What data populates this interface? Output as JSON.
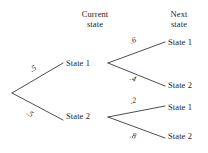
{
  "diagram": {
    "type": "probability-tree",
    "headers": {
      "current": "Current\nstate",
      "next": "Next\nstate"
    },
    "root": {
      "x": 12,
      "y": 93
    },
    "current_states": [
      {
        "id": "cur-1",
        "label": "State 1",
        "x": 66,
        "y": 63,
        "branch_probability": ".5"
      },
      {
        "id": "cur-2",
        "label": "State 2",
        "x": 66,
        "y": 116,
        "branch_probability": ".5"
      }
    ],
    "next_states": [
      {
        "id": "leaf-1",
        "label": "State 1",
        "from": "cur-1",
        "probability": ".6",
        "x": 168,
        "y": 42
      },
      {
        "id": "leaf-2",
        "label": "State 2",
        "from": "cur-1",
        "probability": ".4",
        "x": 168,
        "y": 85
      },
      {
        "id": "leaf-3",
        "label": "State 1",
        "from": "cur-2",
        "probability": ".2",
        "x": 168,
        "y": 107
      },
      {
        "id": "leaf-4",
        "label": "State 2",
        "from": "cur-2",
        "probability": ".8",
        "x": 168,
        "y": 136
      }
    ],
    "colors": {
      "background": "#ffffff",
      "line": "#3a3a3a",
      "text": "#1c1c1c"
    }
  }
}
